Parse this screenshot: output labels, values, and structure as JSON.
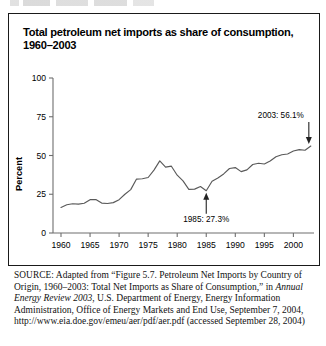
{
  "figure": {
    "title": "Total petroleum net imports as share of consumption, 1960–2003",
    "title_line1": "Total petroleum net imports as share of consumption,",
    "title_line2": "1960–2003"
  },
  "source_note": {
    "label": "SOURCE:",
    "text_part1": " Adapted from “Figure 5.7. Petroleum Net Imports by Country of Origin, 1960–2003: Total Net Imports as Share of Consumption,” in ",
    "italic_title": "Annual Energy Review 2003",
    "text_part2": ", U.S. Department of Energy, Energy Information Administration, Office of Energy Markets and End Use, September 7, 2004, http://www.eia.doe.gov/emeu/aer/pdf/aer.pdf (accessed September 28, 2004)"
  },
  "colors": {
    "line": "#5a5a5a",
    "axis": "#6e6e6e",
    "text": "#000000",
    "border": "#1a1a1a",
    "background": "#ffffff"
  },
  "chart_data": {
    "type": "line",
    "title": "Total petroleum net imports as share of consumption, 1960–2003",
    "xlabel": "",
    "ylabel": "Percent",
    "xlim": [
      1960,
      2003
    ],
    "ylim": [
      0,
      100
    ],
    "yticks": [
      0,
      25,
      50,
      75,
      100
    ],
    "ytick_labels": [
      "0",
      "25",
      "50",
      "75",
      "100"
    ],
    "xticks": [
      1960,
      1965,
      1970,
      1975,
      1980,
      1985,
      1990,
      1995,
      2000
    ],
    "xtick_labels": [
      "1960",
      "1965",
      "1970",
      "1975",
      "1980",
      "1985",
      "1990",
      "1995",
      "2000"
    ],
    "grid": false,
    "legend": false,
    "series": [
      {
        "name": "Total petroleum net imports as share of consumption",
        "x": [
          1960,
          1961,
          1962,
          1963,
          1964,
          1965,
          1966,
          1967,
          1968,
          1969,
          1970,
          1971,
          1972,
          1973,
          1974,
          1975,
          1976,
          1977,
          1978,
          1979,
          1980,
          1981,
          1982,
          1983,
          1984,
          1985,
          1986,
          1987,
          1988,
          1989,
          1990,
          1991,
          1992,
          1993,
          1994,
          1995,
          1996,
          1997,
          1998,
          1999,
          2000,
          2001,
          2002,
          2003
        ],
        "values": [
          16.5,
          18.2,
          18.9,
          18.6,
          19.2,
          21.5,
          21.6,
          19.3,
          19.0,
          19.6,
          21.5,
          25.0,
          28.0,
          34.8,
          35.0,
          35.8,
          40.6,
          46.5,
          42.5,
          43.1,
          37.3,
          33.6,
          28.1,
          28.3,
          30.0,
          27.3,
          33.4,
          35.5,
          38.1,
          41.6,
          42.2,
          39.6,
          40.7,
          44.2,
          45.0,
          44.5,
          46.4,
          49.2,
          50.5,
          51.0,
          52.9,
          53.8,
          53.4,
          56.1
        ]
      }
    ],
    "annotations": [
      {
        "label": "2003: 56.1%",
        "year": 2003,
        "value": 56.1,
        "arrow": "down"
      },
      {
        "label": "1985: 27.3%",
        "year": 1985,
        "value": 27.3,
        "arrow": "up"
      }
    ]
  }
}
